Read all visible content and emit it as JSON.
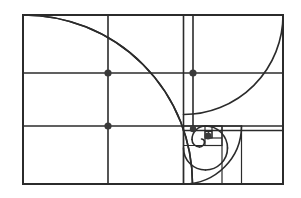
{
  "figure": {
    "name": "fibonacci-golden-spiral",
    "title": "Fibonacci golden spiral construction",
    "background_color": "#ffffff",
    "stroke_color": "#2b2b2b",
    "accent_color": "#3a3a3a",
    "fill": "none",
    "canvas": {
      "width": 301,
      "height": 198
    },
    "outer_rectangle": {
      "x": 23,
      "y": 15,
      "width": 260,
      "height": 169
    },
    "stroke_widths": {
      "outer": 2.0,
      "grid": 1.6,
      "inner": 1.2,
      "spiral": 1.6
    },
    "grid_lines": {
      "vertical_x": [
        108,
        183.5,
        193,
        222.5
      ],
      "horizontal_y": [
        73,
        126,
        145.5,
        156
      ]
    },
    "squares": [
      {
        "name": "square-1",
        "x": 23,
        "y": 15,
        "size": 169
      },
      {
        "name": "square-2",
        "x": 23,
        "y": 15,
        "size": 169
      },
      {
        "name": "square-3",
        "x": 183.5,
        "y": 15,
        "size": 99.5
      },
      {
        "name": "square-4",
        "x": 183.5,
        "y": 126,
        "size": 58
      },
      {
        "name": "square-5",
        "x": 222,
        "y": 126,
        "size": 39
      },
      {
        "name": "square-6",
        "x": 183.5,
        "y": 145,
        "size": 22
      },
      {
        "name": "square-7",
        "x": 205,
        "y": 126,
        "size": 17
      },
      {
        "name": "square-8",
        "x": 205,
        "y": 139,
        "size": 9
      }
    ],
    "spiral_arcs": [
      {
        "name": "arc-1",
        "center_x": 23,
        "center_y": 184,
        "radius": 169,
        "from": "top-right",
        "to": "bottom-left"
      },
      {
        "name": "arc-2",
        "center_x": 183.5,
        "center_y": 184,
        "radius": 99.5,
        "from": "left",
        "to": "top"
      },
      {
        "name": "arc-3",
        "center_x": 183.5,
        "center_y": 126,
        "radius": 58,
        "from": "bottom",
        "to": "right"
      },
      {
        "name": "arc-4",
        "center_x": 222,
        "center_y": 126,
        "radius": 39,
        "from": "left",
        "to": "bottom"
      },
      {
        "name": "arc-5",
        "center_x": 222,
        "center_y": 165,
        "radius": 22,
        "from": "top",
        "to": "left"
      },
      {
        "name": "arc-6",
        "center_x": 205,
        "center_y": 145,
        "radius": 17,
        "from": "right",
        "to": "top"
      },
      {
        "name": "arc-7",
        "center_x": 205,
        "center_y": 139,
        "radius": 9,
        "from": "bottom",
        "to": "right"
      }
    ],
    "intersection_dots": [
      {
        "name": "dot-upper-left",
        "cx": 108,
        "cy": 73,
        "r": 3.6
      },
      {
        "name": "dot-upper-right",
        "cx": 193,
        "cy": 73,
        "r": 3.6
      },
      {
        "name": "dot-lower-left",
        "cx": 108,
        "cy": 126,
        "r": 3.6
      },
      {
        "name": "dot-inner-a",
        "cx": 193,
        "cy": 129,
        "r": 3.2
      },
      {
        "name": "dot-inner-b",
        "cx": 208,
        "cy": 136,
        "r": 3.4
      }
    ],
    "golden_ratio": "1.618",
    "caption": ""
  }
}
